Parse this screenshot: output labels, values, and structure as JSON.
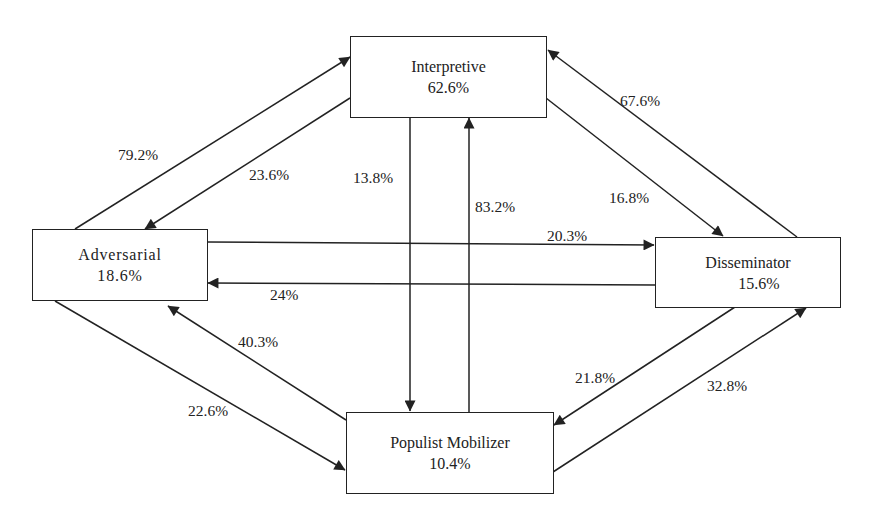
{
  "nodes": {
    "interpretive": {
      "name": "Interpretive",
      "pct": "62.6%"
    },
    "adversarial": {
      "name": "Adversarial",
      "pct": "18.6%"
    },
    "disseminator": {
      "name": "Disseminator",
      "pct": "15.6%"
    },
    "populist": {
      "name": "Populist Mobilizer",
      "pct": "10.4%"
    }
  },
  "edges": {
    "adversarial_to_interpretive": {
      "from": "Adversarial",
      "to": "Interpretive",
      "label": "79.2%"
    },
    "interpretive_to_adversarial": {
      "from": "Interpretive",
      "to": "Adversarial",
      "label": "23.6%"
    },
    "interpretive_to_populist": {
      "from": "Interpretive",
      "to": "Populist Mobilizer",
      "label": "13.8%"
    },
    "populist_to_interpretive": {
      "from": "Populist Mobilizer",
      "to": "Interpretive",
      "label": "83.2%"
    },
    "disseminator_to_interpretive": {
      "from": "Disseminator",
      "to": "Interpretive",
      "label": "67.6%"
    },
    "interpretive_to_disseminator": {
      "from": "Interpretive",
      "to": "Disseminator",
      "label": "16.8%"
    },
    "adversarial_to_disseminator": {
      "from": "Adversarial",
      "to": "Disseminator",
      "label": "20.3%"
    },
    "disseminator_to_adversarial": {
      "from": "Disseminator",
      "to": "Adversarial",
      "label": "24%"
    },
    "populist_to_adversarial": {
      "from": "Populist Mobilizer",
      "to": "Adversarial",
      "label": "40.3%"
    },
    "adversarial_to_populist": {
      "from": "Adversarial",
      "to": "Populist Mobilizer",
      "label": "22.6%"
    },
    "disseminator_to_populist": {
      "from": "Disseminator",
      "to": "Populist Mobilizer",
      "label": "21.8%"
    },
    "populist_to_disseminator": {
      "from": "Populist Mobilizer",
      "to": "Disseminator",
      "label": "32.8%"
    }
  },
  "colors": {
    "line": "#222222",
    "background": "#ffffff",
    "text": "#222222"
  }
}
